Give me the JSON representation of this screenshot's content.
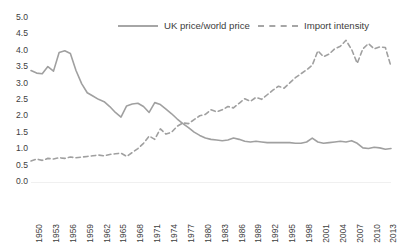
{
  "chart_data": {
    "type": "line",
    "title": "",
    "subtitle": "",
    "xlabel": "",
    "ylabel": "",
    "ylim": [
      0.0,
      5.0
    ],
    "xlim": [
      1950,
      2014
    ],
    "grid": false,
    "legend_position": "top",
    "y_ticks": [
      "5.0",
      "4.5",
      "4.0",
      "3.5",
      "3.0",
      "2.5",
      "2.0",
      "1.5",
      "1.0",
      "0.5",
      "0.0"
    ],
    "y_tick_values": [
      5.0,
      4.5,
      4.0,
      3.5,
      3.0,
      2.5,
      2.0,
      1.5,
      1.0,
      0.5,
      0.0
    ],
    "x_tick_labels": [
      "1950",
      "1953",
      "1956",
      "1959",
      "1962",
      "1965",
      "1968",
      "1971",
      "1974",
      "1977",
      "1980",
      "1983",
      "1986",
      "1989",
      "1992",
      "1995",
      "1998",
      "2001",
      "2004",
      "2007",
      "2010",
      "2013"
    ],
    "x_tick_values": [
      1950,
      1953,
      1956,
      1959,
      1962,
      1965,
      1968,
      1971,
      1974,
      1977,
      1980,
      1983,
      1986,
      1989,
      1992,
      1995,
      1998,
      2001,
      2004,
      2007,
      2010,
      2013
    ],
    "x": [
      1950,
      1951,
      1952,
      1953,
      1954,
      1955,
      1956,
      1957,
      1958,
      1959,
      1960,
      1961,
      1962,
      1963,
      1964,
      1965,
      1966,
      1967,
      1968,
      1969,
      1970,
      1971,
      1972,
      1973,
      1974,
      1975,
      1976,
      1977,
      1978,
      1979,
      1980,
      1981,
      1982,
      1983,
      1984,
      1985,
      1986,
      1987,
      1988,
      1989,
      1990,
      1991,
      1992,
      1993,
      1994,
      1995,
      1996,
      1997,
      1998,
      1999,
      2000,
      2001,
      2002,
      2003,
      2004,
      2005,
      2006,
      2007,
      2008,
      2009,
      2010,
      2011,
      2012,
      2013,
      2014
    ],
    "series": [
      {
        "name": "UK price/world price",
        "style": "solid",
        "color": "#a0a0a0",
        "values": [
          3.4,
          3.32,
          3.3,
          3.52,
          3.38,
          3.95,
          4.0,
          3.92,
          3.4,
          3.0,
          2.72,
          2.62,
          2.52,
          2.45,
          2.3,
          2.12,
          1.98,
          2.32,
          2.38,
          2.4,
          2.3,
          2.12,
          2.42,
          2.36,
          2.22,
          2.08,
          1.92,
          1.78,
          1.66,
          1.52,
          1.42,
          1.34,
          1.3,
          1.28,
          1.26,
          1.28,
          1.34,
          1.3,
          1.24,
          1.22,
          1.24,
          1.22,
          1.2,
          1.2,
          1.2,
          1.2,
          1.2,
          1.18,
          1.18,
          1.22,
          1.34,
          1.22,
          1.18,
          1.2,
          1.22,
          1.24,
          1.22,
          1.26,
          1.18,
          1.04,
          1.02,
          1.06,
          1.04,
          1.0,
          1.02
        ]
      },
      {
        "name": "Import intensity",
        "style": "dashed",
        "color": "#a0a0a0",
        "values": [
          0.64,
          0.7,
          0.66,
          0.72,
          0.7,
          0.74,
          0.72,
          0.76,
          0.74,
          0.76,
          0.78,
          0.8,
          0.82,
          0.8,
          0.84,
          0.86,
          0.88,
          0.78,
          0.9,
          1.02,
          1.18,
          1.4,
          1.3,
          1.62,
          1.46,
          1.52,
          1.7,
          1.8,
          1.78,
          1.9,
          2.02,
          2.06,
          2.2,
          2.14,
          2.2,
          2.3,
          2.26,
          2.4,
          2.54,
          2.46,
          2.58,
          2.52,
          2.66,
          2.8,
          2.92,
          2.86,
          3.02,
          3.18,
          3.3,
          3.42,
          3.56,
          4.0,
          3.82,
          3.9,
          4.06,
          4.14,
          4.32,
          4.04,
          3.62,
          4.06,
          4.22,
          4.06,
          4.12,
          4.1,
          3.52
        ]
      }
    ]
  }
}
